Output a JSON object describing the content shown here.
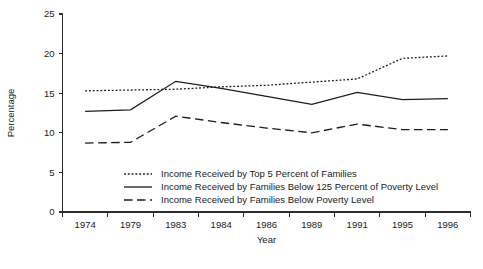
{
  "chart_data": {
    "type": "line",
    "title": "",
    "xlabel": "Year",
    "ylabel": "Percentage",
    "categories": [
      "1974",
      "1979",
      "1983",
      "1984",
      "1986",
      "1989",
      "1991",
      "1995",
      "1996"
    ],
    "ylim": [
      0,
      25
    ],
    "yticks": [
      0,
      5,
      10,
      15,
      20,
      25
    ],
    "ytick_labels": [
      "0",
      "5",
      "10",
      "15",
      "20",
      "25"
    ],
    "grid": false,
    "legend_position": "bottom-center",
    "series": [
      {
        "name": "Income Received by Top 5 Percent of Families",
        "style": "dotted",
        "values": [
          15.3,
          15.4,
          15.5,
          15.8,
          16.0,
          16.4,
          16.8,
          19.4,
          19.7
        ]
      },
      {
        "name": "Income Received by Families Below 125 Percent of Poverty Level",
        "style": "solid",
        "values": [
          12.7,
          12.9,
          16.5,
          15.6,
          14.6,
          13.6,
          15.1,
          14.2,
          14.3
        ]
      },
      {
        "name": "Income Received by Families Below Poverty Level",
        "style": "dashed",
        "values": [
          8.7,
          8.8,
          12.1,
          11.3,
          10.6,
          10.0,
          11.1,
          10.4,
          10.4
        ]
      }
    ]
  },
  "axes": {
    "y_title": "Percentage",
    "x_title": "Year"
  },
  "legend": {
    "items": [
      {
        "label": "Income Received by Top 5 Percent of Families",
        "style": "dotted"
      },
      {
        "label": "Income Received by Families Below 125 Percent of Poverty Level",
        "style": "solid"
      },
      {
        "label": "Income Received by Families Below Poverty Level",
        "style": "dashed"
      }
    ]
  },
  "colors": {
    "ink": "#1c1c1c",
    "axis": "#2b2b2b",
    "background": "#ffffff"
  }
}
